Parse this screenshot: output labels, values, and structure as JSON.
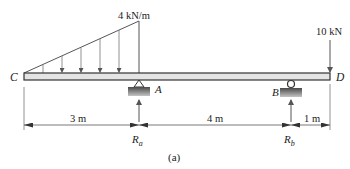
{
  "diagram": {
    "type": "beam-loading",
    "caption": "(a)",
    "colors": {
      "beam_fill": "#e4e4e4",
      "beam_stroke": "#333333",
      "line": "#555555",
      "support_dark": "#555555",
      "support_light": "#bdbdbd"
    },
    "points": {
      "C": "C",
      "A": "A",
      "B": "B",
      "D": "D"
    },
    "loads": {
      "distributed": {
        "label": "4 kN/m",
        "shape": "triangular",
        "from": "C",
        "to": "A",
        "max": "4 kN/m"
      },
      "point": {
        "label": "10 kN",
        "at": "D",
        "direction": "down"
      }
    },
    "supports": {
      "A": {
        "type": "pin"
      },
      "B": {
        "type": "roller"
      }
    },
    "reactions": {
      "Ra": {
        "symbol": "R",
        "subscript": "a"
      },
      "Rb": {
        "symbol": "R",
        "subscript": "b"
      }
    },
    "dimensions": [
      {
        "label": "3 m",
        "from": "C",
        "to": "A"
      },
      {
        "label": "4 m",
        "from": "A",
        "to": "B"
      },
      {
        "label": "1 m",
        "from": "B",
        "to": "D"
      }
    ]
  }
}
